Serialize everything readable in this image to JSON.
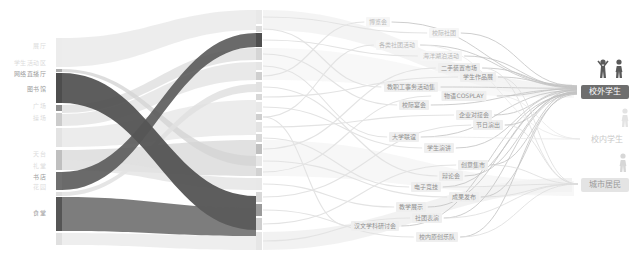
{
  "diagram": {
    "left_nodes": [
      {
        "label": "展厅",
        "y": 45,
        "tone": "faint"
      },
      {
        "label": "学生活动区",
        "y": 62,
        "tone": "faint"
      },
      {
        "label": "网络直播厅",
        "y": 73,
        "tone": "mid"
      },
      {
        "label": "图书馆",
        "y": 88,
        "tone": "mid"
      },
      {
        "label": "广场",
        "y": 105,
        "tone": "faint"
      },
      {
        "label": "操场",
        "y": 117,
        "tone": "faint"
      },
      {
        "label": "天台",
        "y": 153,
        "tone": "faint"
      },
      {
        "label": "礼堂",
        "y": 165,
        "tone": "faint"
      },
      {
        "label": "书店",
        "y": 176,
        "tone": "mid"
      },
      {
        "label": "花园",
        "y": 186,
        "tone": "faint"
      },
      {
        "label": "食堂",
        "y": 212,
        "tone": "mid"
      }
    ],
    "middle_nodes": [
      {
        "label": "博览会",
        "x": 378,
        "y": 22,
        "style": "lite"
      },
      {
        "label": "校际社团",
        "x": 444,
        "y": 33,
        "style": "lite"
      },
      {
        "label": "各类社团活动",
        "x": 397,
        "y": 45,
        "style": "lite"
      },
      {
        "label": "海洋湖泊活动",
        "x": 441,
        "y": 56,
        "style": "lite"
      },
      {
        "label": "二手装置市场",
        "x": 459,
        "y": 68,
        "style": "box"
      },
      {
        "label": "学生作品展",
        "x": 478,
        "y": 77,
        "style": "box"
      },
      {
        "label": "教职工事务活动集",
        "x": 411,
        "y": 87,
        "style": "box"
      },
      {
        "label": "物语COSPLAY",
        "x": 464,
        "y": 96,
        "style": "box"
      },
      {
        "label": "校际宴会",
        "x": 414,
        "y": 105,
        "style": "box"
      },
      {
        "label": "企业对接会",
        "x": 474,
        "y": 115,
        "style": "box"
      },
      {
        "label": "节日演出",
        "x": 488,
        "y": 125,
        "style": "box"
      },
      {
        "label": "大学联谊",
        "x": 404,
        "y": 137,
        "style": "box"
      },
      {
        "label": "学生演讲",
        "x": 439,
        "y": 148,
        "style": "box"
      },
      {
        "label": "创意集市",
        "x": 473,
        "y": 165,
        "style": "box"
      },
      {
        "label": "辩论会",
        "x": 451,
        "y": 176,
        "style": "box"
      },
      {
        "label": "电子竞技",
        "x": 426,
        "y": 187,
        "style": "box"
      },
      {
        "label": "成果发布",
        "x": 464,
        "y": 197,
        "style": "box"
      },
      {
        "label": "教学展示",
        "x": 411,
        "y": 207,
        "style": "box"
      },
      {
        "label": "社团表演",
        "x": 427,
        "y": 218,
        "style": "box"
      },
      {
        "label": "汉文学科研讨会",
        "x": 375,
        "y": 226,
        "style": "box"
      },
      {
        "label": "校内原创乐队",
        "x": 437,
        "y": 237,
        "style": "box"
      }
    ],
    "right_nodes": [
      {
        "label": "校外学生",
        "x": 605,
        "y": 92,
        "emphasis": "dark"
      },
      {
        "label": "校内学生",
        "x": 607,
        "y": 140,
        "emphasis": "faint"
      },
      {
        "label": "城市居民",
        "x": 605,
        "y": 185,
        "emphasis": "light"
      }
    ],
    "colors": {
      "dark_flow": "#4f4f4f",
      "light_flow": "#e9e9e9",
      "mid_flow": "#d9d9d9",
      "connector": "#c2c2c2",
      "connector_light": "#dedede",
      "node_dark_bg": "#6e6e6e",
      "node_light_bg": "#e4e4e4",
      "faint_text": "#c9c9c9"
    }
  },
  "chart_data": {
    "type": "sankey",
    "title": "",
    "columns": [
      "场地/渠道",
      "活动类型",
      "人群"
    ],
    "left_nodes": [
      "展厅",
      "学生活动区",
      "网络直播厅",
      "图书馆",
      "广场",
      "操场",
      "天台",
      "礼堂",
      "书店",
      "花园",
      "食堂"
    ],
    "middle_nodes": [
      "博览会",
      "校际社团",
      "各类社团活动",
      "海洋湖泊活动",
      "二手装置市场",
      "学生作品展",
      "教职工事务活动集",
      "物语COSPLAY",
      "校际宴会",
      "企业对接会",
      "节日演出",
      "大学联谊",
      "学生演讲",
      "创意集市",
      "辩论会",
      "电子竞技",
      "成果发布",
      "教学展示",
      "社团表演",
      "汉文学科研讨会",
      "校内原创乐队"
    ],
    "right_nodes": [
      "校外学生",
      "校内学生",
      "城市居民"
    ],
    "links": [
      {
        "from": "网络直播厅",
        "to": "活动类型",
        "weight": 3,
        "shade": "dark"
      },
      {
        "from": "书店",
        "to": "活动类型",
        "weight": 2,
        "shade": "dark"
      },
      {
        "from": "食堂",
        "to": "活动类型",
        "weight": 3,
        "shade": "dark"
      },
      {
        "from": "middle_nodes(all)",
        "to": "校外学生",
        "weight": 1,
        "shade": "mid"
      },
      {
        "from": "middle_nodes(部分)",
        "to": "城市居民",
        "weight": 0.5,
        "shade": "light"
      },
      {
        "from": "middle_nodes(少量)",
        "to": "校内学生",
        "weight": 0.3,
        "shade": "light"
      }
    ],
    "legend": "none",
    "grid": false
  }
}
